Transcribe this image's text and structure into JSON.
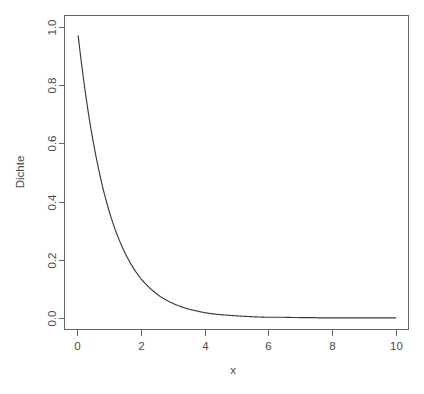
{
  "figure": {
    "background_color": "#ffffff",
    "frame_color": "#666666",
    "curve_color": "#3a3a3a",
    "text_color": "#4a4a4a"
  },
  "chart_data": {
    "type": "line",
    "title": "",
    "subtitle": "",
    "xlabel": "x",
    "ylabel": "Dichte",
    "xlim": [
      -0.4,
      10.4
    ],
    "ylim": [
      -0.04,
      1.04
    ],
    "xticks": [
      0,
      2,
      4,
      6,
      8,
      10
    ],
    "xtick_labels": [
      "0",
      "2",
      "4",
      "6",
      "8",
      "10"
    ],
    "yticks": [
      0.0,
      0.2,
      0.4,
      0.6,
      0.8,
      1.0
    ],
    "ytick_labels": [
      "0.0",
      "0.2",
      "0.4",
      "0.6",
      "0.8",
      "1.0"
    ],
    "grid": false,
    "legend": false,
    "legend_position": "none",
    "annotations": [],
    "series": [
      {
        "name": "Exponentialdichte",
        "description": "Dichte der Exponentialverteilung mit Rate 1",
        "x": [
          0.03,
          0.1,
          0.2,
          0.3,
          0.4,
          0.5,
          0.6,
          0.7,
          0.8,
          0.9,
          1.0,
          1.2,
          1.4,
          1.6,
          1.8,
          2.0,
          2.2,
          2.4,
          2.6,
          2.8,
          3.0,
          3.25,
          3.5,
          3.75,
          4.0,
          4.25,
          4.5,
          4.75,
          5.0,
          5.5,
          6.0,
          6.5,
          7.0,
          7.5,
          8.0,
          8.5,
          9.0,
          9.5,
          10.0
        ],
        "y": [
          0.97,
          0.905,
          0.819,
          0.741,
          0.67,
          0.607,
          0.549,
          0.497,
          0.449,
          0.407,
          0.368,
          0.301,
          0.247,
          0.202,
          0.165,
          0.135,
          0.111,
          0.091,
          0.074,
          0.061,
          0.05,
          0.039,
          0.03,
          0.024,
          0.018,
          0.014,
          0.011,
          0.009,
          0.007,
          0.004,
          0.002,
          0.002,
          0.001,
          0.001,
          0.0,
          0.0,
          0.0,
          0.0,
          0.0
        ]
      }
    ]
  }
}
